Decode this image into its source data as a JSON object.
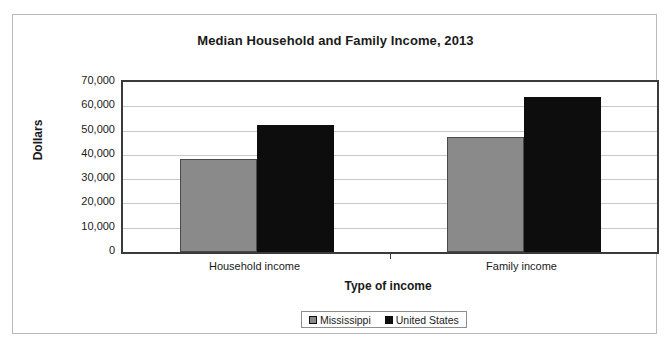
{
  "chart_data": {
    "type": "bar",
    "title": "Median Household and Family Income, 2013",
    "xlabel": "Type of income",
    "ylabel": "Dollars",
    "categories": [
      "Household income",
      "Family income"
    ],
    "series": [
      {
        "name": "Mississippi",
        "color": "#8a8a8a",
        "values": [
          38300,
          47300
        ]
      },
      {
        "name": "United States",
        "color": "#0d0d0d",
        "values": [
          52300,
          63800
        ]
      }
    ],
    "ylim": [
      0,
      70000
    ],
    "ytick_values": [
      0,
      10000,
      20000,
      30000,
      40000,
      50000,
      60000,
      70000
    ],
    "ytick_labels": [
      "0",
      "10,000",
      "20,000",
      "30,000",
      "40,000",
      "50,000",
      "60,000",
      "70,000"
    ],
    "grid": true,
    "legend_position": "bottom"
  }
}
